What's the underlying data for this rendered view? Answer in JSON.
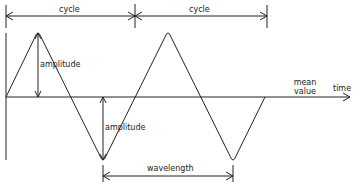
{
  "diagram": {
    "labels": {
      "cycle_1": "cycle",
      "cycle_2": "cycle",
      "amplitude_1": "amplitude",
      "amplitude_2": "amplitude",
      "mean_value_line1": "mean",
      "mean_value_line2": "value",
      "time": "time",
      "wavelength": "wavelength"
    },
    "colors": {
      "stroke": "#222222",
      "background": "#ffffff"
    }
  }
}
